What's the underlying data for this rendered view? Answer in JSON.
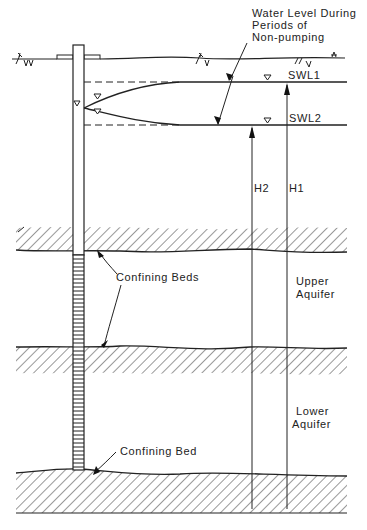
{
  "diagram": {
    "type": "cross-section",
    "labels": {
      "water_level_line1": "Water Level During",
      "water_level_line2": "Periods of",
      "water_level_line3": "Non-pumping",
      "swl1": "SWL1",
      "swl2": "SWL2",
      "h1": "H1",
      "h2": "H2",
      "confining_beds": "Confining Beds",
      "upper_aquifer_line1": "Upper",
      "upper_aquifer_line2": "Aquifer",
      "lower_aquifer_line1": "Lower",
      "lower_aquifer_line2": "Aquifer",
      "confining_bed": "Confining Bed"
    },
    "colors": {
      "line": "#222222",
      "background": "#ffffff"
    }
  }
}
